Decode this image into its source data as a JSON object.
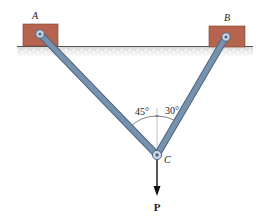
{
  "diagram": {
    "type": "statics-two-member-frame",
    "supports": [
      {
        "id": "A",
        "label": "A",
        "block_color": "#b5654f"
      },
      {
        "id": "B",
        "label": "B",
        "block_color": "#b5654f"
      }
    ],
    "joint": {
      "label": "C"
    },
    "members": [
      {
        "from": "A",
        "to": "C",
        "angle_label": "45°",
        "color": "#6d89a6"
      },
      {
        "from": "B",
        "to": "C",
        "angle_label": "30°",
        "color": "#6d89a6"
      }
    ],
    "load": {
      "label": "P",
      "direction": "down"
    },
    "ground_color": "#d9d9d9"
  }
}
